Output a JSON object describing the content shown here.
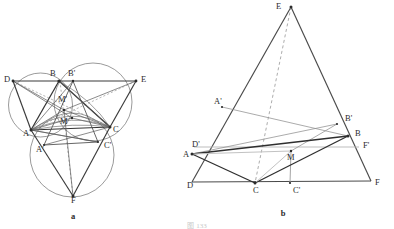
{
  "figure": {
    "title_caption": "图 133",
    "panels": [
      {
        "id": "a",
        "caption": "a"
      },
      {
        "id": "b",
        "caption": "b"
      }
    ]
  },
  "colors": {
    "stroke_main": "#3a3a3a",
    "stroke_thin": "#6b6b6b",
    "stroke_light": "#9a9a9a",
    "stroke_circle": "#555555",
    "dashed": "#8a8a8a",
    "label": "#2b2b2b",
    "background": "#ffffff"
  },
  "panel_a": {
    "caption": "a",
    "labels": [
      {
        "name": "D",
        "text": "D",
        "x": 4,
        "y": 82
      },
      {
        "name": "B",
        "text": "B",
        "x": 50,
        "y": 76
      },
      {
        "name": "Bp",
        "text": "B'",
        "x": 68,
        "y": 76
      },
      {
        "name": "E",
        "text": "E",
        "x": 141,
        "y": 82
      },
      {
        "name": "Mp",
        "text": "M'",
        "x": 58,
        "y": 102
      },
      {
        "name": "M",
        "text": "M",
        "x": 60,
        "y": 124
      },
      {
        "name": "A",
        "text": "A",
        "x": 23,
        "y": 136
      },
      {
        "name": "C",
        "text": "C",
        "x": 113,
        "y": 132
      },
      {
        "name": "Ap",
        "text": "A'",
        "x": 36,
        "y": 152
      },
      {
        "name": "Cp",
        "text": "C'",
        "x": 104,
        "y": 148
      },
      {
        "name": "F",
        "text": "F",
        "x": 71,
        "y": 203
      }
    ],
    "circles": [
      {
        "name": "circle-left",
        "cx": 40.5,
        "cy": 105,
        "r": 32
      },
      {
        "name": "circle-right",
        "cx": 93,
        "cy": 102,
        "r": 39
      },
      {
        "name": "circle-bottom",
        "cx": 72,
        "cy": 155,
        "r": 42
      }
    ],
    "points": {
      "A": [
        31,
        130
      ],
      "B": [
        59,
        81
      ],
      "C": [
        110,
        127
      ],
      "D": [
        13,
        81
      ],
      "E": [
        136,
        81
      ],
      "F": [
        73,
        196
      ],
      "Ap": [
        44,
        145
      ],
      "Bp": [
        73,
        81
      ],
      "Cp": [
        98,
        142
      ],
      "M": [
        72,
        118
      ],
      "Mp": [
        64,
        110
      ]
    }
  },
  "panel_b": {
    "caption": "b",
    "labels": [
      {
        "name": "E",
        "text": "E",
        "x": 276,
        "y": 9
      },
      {
        "name": "Ap",
        "text": "A'",
        "x": 214,
        "y": 104
      },
      {
        "name": "Bp",
        "text": "B'",
        "x": 345,
        "y": 121
      },
      {
        "name": "B",
        "text": "B",
        "x": 355,
        "y": 136
      },
      {
        "name": "Dp",
        "text": "D'",
        "x": 192,
        "y": 147
      },
      {
        "name": "Fp",
        "text": "F'",
        "x": 363,
        "y": 148
      },
      {
        "name": "A",
        "text": "A",
        "x": 183,
        "y": 157
      },
      {
        "name": "M",
        "text": "M",
        "x": 287,
        "y": 160
      },
      {
        "name": "D",
        "text": "D",
        "x": 187,
        "y": 188
      },
      {
        "name": "C",
        "text": "C",
        "x": 253,
        "y": 193
      },
      {
        "name": "Cp",
        "text": "C'",
        "x": 293,
        "y": 193
      },
      {
        "name": "F",
        "text": "F",
        "x": 375,
        "y": 185
      }
    ],
    "points": {
      "E": [
        291,
        7
      ],
      "D": [
        192,
        182
      ],
      "F": [
        371,
        181
      ],
      "A": [
        192,
        154
      ],
      "B": [
        348,
        136
      ],
      "C": [
        255,
        183
      ],
      "Ap": [
        222,
        107
      ],
      "Bp": [
        337,
        124
      ],
      "Cp": [
        290,
        183
      ],
      "Dp": [
        199,
        147
      ],
      "Fp": [
        357,
        147
      ],
      "M": [
        291,
        151
      ]
    }
  }
}
